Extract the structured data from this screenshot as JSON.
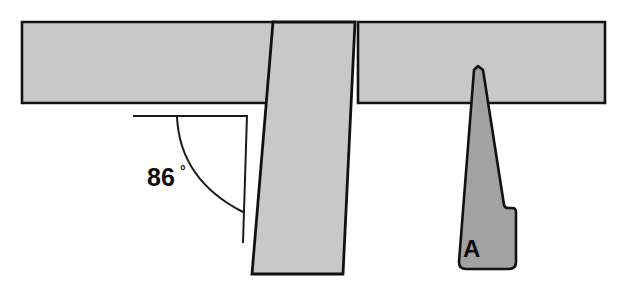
{
  "figure": {
    "colors": {
      "background": "#ffffff",
      "member_fill": "#c8c8c8",
      "wedge_fill": "#a2a2a2",
      "outline": "#111111",
      "annotation_line": "#1a1a1a",
      "text": "#0d0d0d"
    },
    "annotations": {
      "angle": {
        "value": "86",
        "unit": "°",
        "full_text": "86°",
        "description": "angle between horizontal reference line and the inclined post edge"
      },
      "part": {
        "label": "A",
        "description": "tapered wedge component labelled A"
      }
    },
    "parts": [
      {
        "name": "horizontal-bar-left",
        "fill": "#c8c8c8"
      },
      {
        "name": "horizontal-bar-right",
        "fill": "#c8c8c8"
      },
      {
        "name": "vertical-post",
        "fill": "#c8c8c8"
      },
      {
        "name": "wedge-part-a",
        "fill": "#a2a2a2"
      }
    ]
  }
}
